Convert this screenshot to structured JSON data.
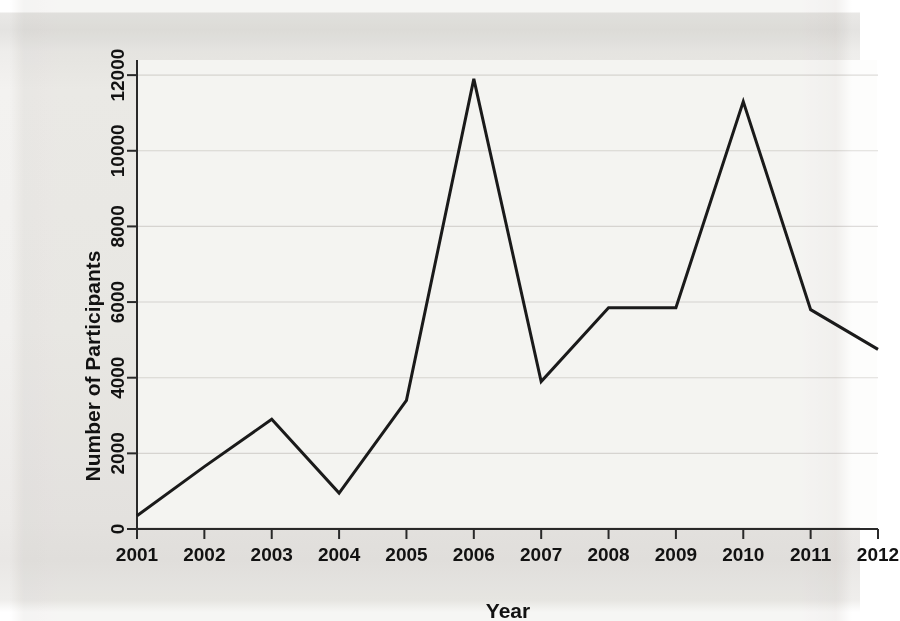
{
  "figure": {
    "background_color": "#f2f1ef",
    "plot_background_color": "#fdfdfc",
    "line_color": "#1b1b1b",
    "grid_color": "#dedcda",
    "axis_color": "#2a2a2a"
  },
  "chart_data": {
    "type": "line",
    "title": "",
    "xlabel": "Year",
    "ylabel": "Number of Participants",
    "categories": [
      "2001",
      "2002",
      "2003",
      "2004",
      "2005",
      "2006",
      "2007",
      "2008",
      "2009",
      "2010",
      "2011",
      "2012"
    ],
    "values": [
      350,
      1650,
      2900,
      950,
      3400,
      11900,
      3900,
      5850,
      5850,
      11300,
      5800,
      4750
    ],
    "x": [
      2001,
      2002,
      2003,
      2004,
      2005,
      2006,
      2007,
      2008,
      2009,
      2010,
      2011,
      2012
    ],
    "xlim": [
      2001,
      2012
    ],
    "ylim": [
      0,
      12400
    ],
    "ytick_labels": [
      "0",
      "2000",
      "4000",
      "6000",
      "8000",
      "10000",
      "12000"
    ],
    "yticks": [
      0,
      2000,
      4000,
      6000,
      8000,
      10000,
      12000
    ],
    "xtick_labels": [
      "2001",
      "2002",
      "2003",
      "2004",
      "2005",
      "2006",
      "2007",
      "2008",
      "2009",
      "2010",
      "2011",
      "2012"
    ],
    "grid": "horizontal",
    "legend": "none",
    "series": [
      {
        "name": "Number of Participants",
        "values": [
          350,
          1650,
          2900,
          950,
          3400,
          11900,
          3900,
          5850,
          5850,
          11300,
          5800,
          4750
        ]
      }
    ],
    "annotations": []
  }
}
